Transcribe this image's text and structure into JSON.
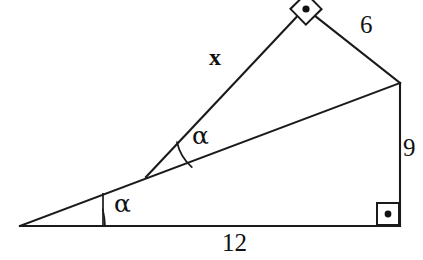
{
  "figure": {
    "kind": "geometry-diagram",
    "background_color": "#ffffff",
    "stroke_color": "#1a1a1a",
    "width": 423,
    "height": 260
  },
  "points": {
    "left_apex": {
      "name": "A",
      "x": 20,
      "y": 226
    },
    "bottom_right": {
      "name": "D",
      "x": 400,
      "y": 226
    },
    "right": {
      "name": "C",
      "x": 400,
      "y": 83
    },
    "top": {
      "name": "B",
      "x": 305,
      "y": 8
    },
    "middle": {
      "name": "M",
      "x": 146,
      "y": 177
    }
  },
  "segments": [
    {
      "name": "base",
      "from": "left_apex",
      "to": "bottom_right",
      "label": "12"
    },
    {
      "name": "vertical-right",
      "from": "bottom_right",
      "to": "right",
      "label": "9"
    },
    {
      "name": "long-diagonal",
      "from": "left_apex",
      "to": "right",
      "label": ""
    },
    {
      "name": "upper-right-side",
      "from": "right",
      "to": "top",
      "label": "6"
    },
    {
      "name": "unknown-side",
      "from": "top",
      "to": "middle",
      "label": "x"
    }
  ],
  "labels": {
    "unknown_side": "x",
    "upper_side": "6",
    "vertical_side": "9",
    "base_side": "12",
    "angle_upper": "α",
    "angle_lower": "α"
  },
  "angle_marks": [
    {
      "name": "angle-alpha-upper",
      "at": "middle",
      "symbol": "α",
      "type": "arc",
      "between": [
        "unknown-side",
        "long-diagonal"
      ]
    },
    {
      "name": "angle-alpha-lower",
      "at": "left_apex",
      "symbol": "α",
      "type": "arc",
      "between": [
        "long-diagonal",
        "base"
      ]
    }
  ],
  "right_angles": [
    {
      "name": "right-angle-top",
      "at": "top",
      "style": "rotated-square-with-dot",
      "measure": "90"
    },
    {
      "name": "right-angle-bottom-right",
      "at": "bottom_right",
      "style": "square-with-dot",
      "measure": "90"
    }
  ]
}
